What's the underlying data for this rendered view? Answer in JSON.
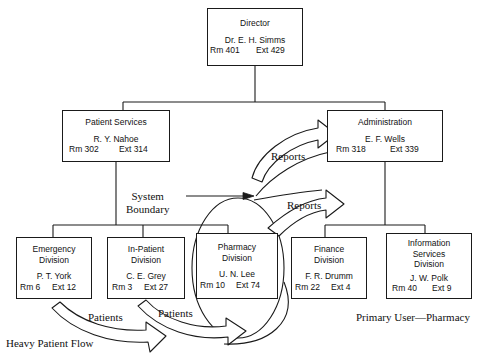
{
  "diagram": {
    "stroke_color": "#1a1a1a",
    "background_color": "#ffffff"
  },
  "nodes": [
    {
      "id": "director",
      "title": "Director",
      "title2": "",
      "title3": "",
      "person": "Dr. E. H. Simms",
      "room": "Rm 401",
      "ext": "Ext 429"
    },
    {
      "id": "patient-services",
      "title": "Patient Services",
      "title2": "",
      "title3": "",
      "person": "R. Y. Nahoe",
      "room": "Rm 302",
      "ext": "Ext 314"
    },
    {
      "id": "administration",
      "title": "Administration",
      "title2": "",
      "title3": "",
      "person": "E. F. Wells",
      "room": "Rm 318",
      "ext": "Ext 339"
    },
    {
      "id": "emergency",
      "title": "Emergency",
      "title2": "Division",
      "title3": "",
      "person": "P. T. York",
      "room": "Rm 6",
      "ext": "Ext 12"
    },
    {
      "id": "in-patient",
      "title": "In-Patient",
      "title2": "Division",
      "title3": "",
      "person": "C. E. Grey",
      "room": "Rm 3",
      "ext": "Ext 27"
    },
    {
      "id": "pharmacy",
      "title": "Pharmacy",
      "title2": "Division",
      "title3": "",
      "person": "U. N. Lee",
      "room": "Rm 10",
      "ext": "Ext 74"
    },
    {
      "id": "finance",
      "title": "Finance",
      "title2": "Division",
      "title3": "",
      "person": "F. R. Drumm",
      "room": "Rm 22",
      "ext": "Ext 4"
    },
    {
      "id": "information-services",
      "title": "Information",
      "title2": "Services",
      "title3": "Division",
      "person": "J. W. Polk",
      "room": "Rm 40",
      "ext": "Ext 9"
    }
  ],
  "annotations": {
    "system_boundary_line1": "System",
    "system_boundary_line2": "Boundary",
    "reports_1": "Reports",
    "reports_2": "Reports",
    "patients_1": "Patients",
    "patients_2": "Patients",
    "heavy_patient_flow": "Heavy Patient Flow",
    "primary_user": "Primary User—Pharmacy"
  }
}
